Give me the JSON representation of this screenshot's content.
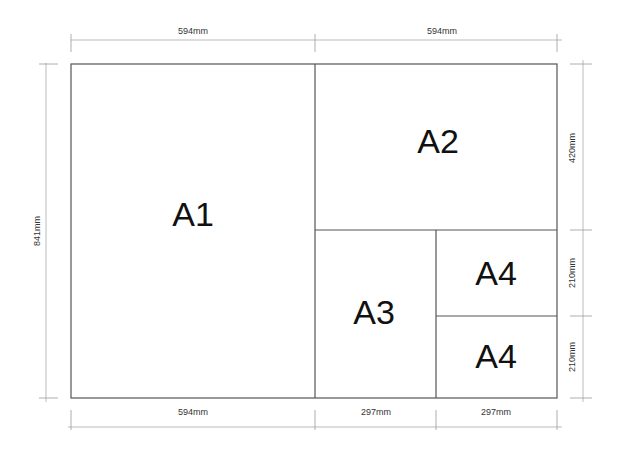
{
  "diagram": {
    "sheets": [
      {
        "label": "A1"
      },
      {
        "label": "A2"
      },
      {
        "label": "A3"
      },
      {
        "label": "A4"
      },
      {
        "label": "A4"
      }
    ],
    "dimensions": {
      "top": [
        "594mm",
        "594mm"
      ],
      "bottom": [
        "594mm",
        "297mm",
        "297mm"
      ],
      "left": "841mm",
      "right": [
        "420mm",
        "210mm",
        "210mm"
      ]
    },
    "colors": {
      "outline": "#555555",
      "dimension_line": "#aaaaaa",
      "text": "#111111"
    }
  }
}
